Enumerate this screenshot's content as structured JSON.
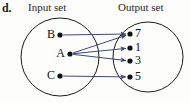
{
  "figure": {
    "part_label": "d.",
    "input_caption": "Input set",
    "output_caption": "Output set",
    "type": "mapping-diagram",
    "colors": {
      "circle_stroke": "#1b1b1b",
      "arrow": "#3a4a7a",
      "dot": "#101010",
      "text": "#111111",
      "background": "#fdfdfc"
    },
    "input_set": {
      "circle": {
        "cx": 60,
        "cy": 57,
        "r": 39
      },
      "nodes": [
        {
          "label": "B",
          "x": 60,
          "y": 35
        },
        {
          "label": "A",
          "x": 70,
          "y": 54
        },
        {
          "label": "C",
          "x": 60,
          "y": 76
        }
      ]
    },
    "output_set": {
      "circle": {
        "cx": 148,
        "cy": 57,
        "r": 35
      },
      "nodes": [
        {
          "label": "7",
          "x": 130,
          "y": 34
        },
        {
          "label": "1",
          "x": 130,
          "y": 48
        },
        {
          "label": "3",
          "x": 130,
          "y": 61
        },
        {
          "label": "5",
          "x": 130,
          "y": 77
        }
      ]
    },
    "mappings": [
      {
        "from": "B",
        "to": "7"
      },
      {
        "from": "A",
        "to": "7"
      },
      {
        "from": "A",
        "to": "1"
      },
      {
        "from": "A",
        "to": "3"
      },
      {
        "from": "C",
        "to": "5"
      }
    ]
  }
}
